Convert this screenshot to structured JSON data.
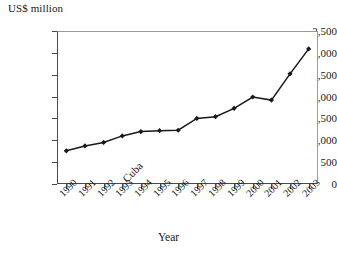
{
  "chart_data": {
    "type": "line",
    "title": "",
    "subtitle": "",
    "xlabel": "Year",
    "ylabel": "US$ million",
    "categories": [
      "1990",
      "1991",
      "1992",
      "1993",
      "1994",
      "1995",
      "1996",
      "1997",
      "1998",
      "1999",
      "2000",
      "2001",
      "2002",
      "2003"
    ],
    "series": [
      {
        "name": "Cuba",
        "values": [
          760,
          870,
          950,
          1100,
          1200,
          1220,
          1230,
          1500,
          1540,
          1730,
          1990,
          1920,
          2520,
          3090
        ]
      }
    ],
    "ylim": [
      0,
      3500
    ],
    "ytick_labels": [
      "0",
      "500",
      "1,000",
      "1,500",
      "2,000",
      "2,500",
      "3,000",
      "3,500"
    ],
    "ytick_values": [
      0,
      500,
      1000,
      1500,
      2000,
      2500,
      3000,
      3500
    ],
    "grid": false,
    "legend_position": "inline-annotation",
    "annotations": [
      {
        "text": "Cuba",
        "rotation": -45,
        "x_px": 120,
        "y_px": 176
      }
    ],
    "marker": "diamond",
    "line_color": "#1a1a1a",
    "marker_color": "#1a1a1a"
  }
}
